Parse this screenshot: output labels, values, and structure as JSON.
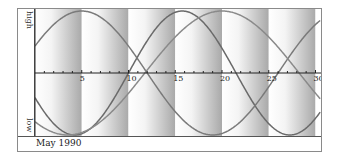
{
  "chart_data": {
    "type": "line",
    "title": "",
    "xlabel": "",
    "ylabel": "",
    "y_axis_labels": {
      "top": "high",
      "bottom": "low"
    },
    "footer_label": "May 1990",
    "x_ticks": [
      5,
      10,
      15,
      20,
      25,
      30
    ],
    "xlim": [
      0,
      30.5
    ],
    "ylim": [
      -1,
      1
    ],
    "grid": false,
    "background_bands": {
      "width_days": 5,
      "style": "white-to-grey gradient per band"
    },
    "series": [
      {
        "name": "physical",
        "period_days": 23,
        "peak_day": 15.75,
        "color": "#6a6a6a"
      },
      {
        "name": "emotional",
        "period_days": 28,
        "peak_day": 5,
        "color": "#7a7a7a"
      },
      {
        "name": "intellectual",
        "period_days": 33,
        "peak_day": 20,
        "color": "#8a8a8a"
      }
    ]
  },
  "labels": {
    "high": "high",
    "low": "low",
    "footer": "May 1990"
  }
}
